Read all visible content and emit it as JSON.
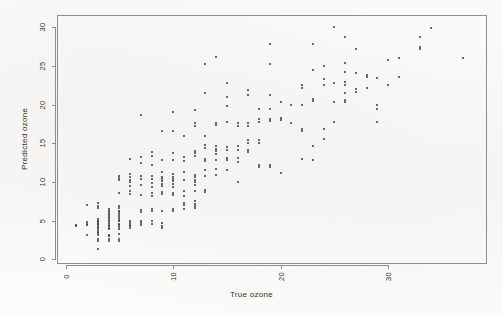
{
  "figure": {
    "width": 503,
    "height": 315,
    "background_color": "#fbfbfa",
    "frame_color": "#8d8d8d",
    "point_color": "#3a3a3a"
  },
  "plot_box": {
    "left": 57,
    "top": 15,
    "right": 487,
    "bottom": 264
  },
  "chart_data": {
    "type": "scatter",
    "title": "",
    "xlabel": "True ozone",
    "ylabel": "Predicted ozone",
    "xlim": [
      -0.8,
      39.2
    ],
    "ylim": [
      -0.6,
      31.6
    ],
    "xticks": [
      0,
      10,
      20,
      30
    ],
    "yticks": [
      0,
      5,
      10,
      15,
      20,
      25,
      30
    ],
    "grid": false,
    "legend": null,
    "marker": "point",
    "marker_size": 2,
    "series": [
      {
        "name": "Predicted vs True ozone",
        "points": [
          [
            1,
            4.4
          ],
          [
            1,
            4.3
          ],
          [
            2,
            7.0
          ],
          [
            2,
            4.8
          ],
          [
            2,
            4.6
          ],
          [
            2,
            4.5
          ],
          [
            2,
            3.2
          ],
          [
            3,
            7.3
          ],
          [
            3,
            6.9
          ],
          [
            3,
            6.6
          ],
          [
            3,
            5.2
          ],
          [
            3,
            5.0
          ],
          [
            3,
            4.9
          ],
          [
            3,
            4.7
          ],
          [
            3,
            4.6
          ],
          [
            3,
            4.4
          ],
          [
            3,
            4.2
          ],
          [
            3,
            4.0
          ],
          [
            3,
            3.8
          ],
          [
            3,
            3.6
          ],
          [
            3,
            3.4
          ],
          [
            3,
            3.2
          ],
          [
            3,
            2.6
          ],
          [
            3,
            2.4
          ],
          [
            3,
            1.3
          ],
          [
            4,
            6.5
          ],
          [
            4,
            6.3
          ],
          [
            4,
            6.1
          ],
          [
            4,
            5.9
          ],
          [
            4,
            5.7
          ],
          [
            4,
            5.5
          ],
          [
            4,
            5.3
          ],
          [
            4,
            5.1
          ],
          [
            4,
            4.9
          ],
          [
            4,
            4.7
          ],
          [
            4,
            4.5
          ],
          [
            4,
            4.3
          ],
          [
            4,
            4.1
          ],
          [
            4,
            3.9
          ],
          [
            4,
            3.2
          ],
          [
            4,
            3.0
          ],
          [
            4,
            2.6
          ],
          [
            4,
            2.4
          ],
          [
            5,
            8.6
          ],
          [
            5,
            6.9
          ],
          [
            5,
            6.6
          ],
          [
            5,
            6.3
          ],
          [
            5,
            6.1
          ],
          [
            5,
            5.9
          ],
          [
            5,
            5.6
          ],
          [
            5,
            5.3
          ],
          [
            5,
            5.1
          ],
          [
            5,
            4.9
          ],
          [
            5,
            4.6
          ],
          [
            5,
            4.4
          ],
          [
            5,
            4.2
          ],
          [
            5,
            3.9
          ],
          [
            5,
            3.3
          ],
          [
            5,
            2.6
          ],
          [
            5,
            2.4
          ],
          [
            5,
            10.8
          ],
          [
            5,
            10.5
          ],
          [
            5,
            10.2
          ],
          [
            6,
            13.0
          ],
          [
            6,
            11.0
          ],
          [
            6,
            10.6
          ],
          [
            6,
            10.3
          ],
          [
            6,
            10.0
          ],
          [
            6,
            9.5
          ],
          [
            6,
            8.8
          ],
          [
            6,
            8.5
          ],
          [
            6,
            5.0
          ],
          [
            6,
            4.7
          ],
          [
            6,
            4.5
          ],
          [
            6,
            4.3
          ],
          [
            6,
            4.0
          ],
          [
            7,
            18.7
          ],
          [
            7,
            13.2
          ],
          [
            7,
            12.4
          ],
          [
            7,
            10.8
          ],
          [
            7,
            10.4
          ],
          [
            7,
            9.6
          ],
          [
            7,
            8.3
          ],
          [
            7,
            6.4
          ],
          [
            7,
            6.1
          ],
          [
            7,
            5.0
          ],
          [
            7,
            4.7
          ],
          [
            7,
            4.5
          ],
          [
            8,
            13.9
          ],
          [
            8,
            13.4
          ],
          [
            8,
            12.2
          ],
          [
            8,
            10.8
          ],
          [
            8,
            10.4
          ],
          [
            8,
            9.9
          ],
          [
            8,
            9.3
          ],
          [
            8,
            8.6
          ],
          [
            8,
            8.2
          ],
          [
            8,
            6.5
          ],
          [
            8,
            6.2
          ],
          [
            8,
            4.9
          ],
          [
            8,
            4.6
          ],
          [
            9,
            16.6
          ],
          [
            9,
            12.8
          ],
          [
            9,
            11.3
          ],
          [
            9,
            10.7
          ],
          [
            9,
            10.4
          ],
          [
            9,
            10.1
          ],
          [
            9,
            9.8
          ],
          [
            9,
            9.5
          ],
          [
            9,
            8.7
          ],
          [
            9,
            8.4
          ],
          [
            9,
            6.2
          ],
          [
            9,
            4.7
          ],
          [
            9,
            4.3
          ],
          [
            9,
            4.0
          ],
          [
            10,
            19.0
          ],
          [
            10,
            16.6
          ],
          [
            10,
            13.8
          ],
          [
            10,
            12.8
          ],
          [
            10,
            11.0
          ],
          [
            10,
            10.7
          ],
          [
            10,
            10.4
          ],
          [
            10,
            10.1
          ],
          [
            10,
            9.8
          ],
          [
            10,
            9.4
          ],
          [
            10,
            8.6
          ],
          [
            10,
            8.3
          ],
          [
            10,
            6.5
          ],
          [
            10,
            6.2
          ],
          [
            11,
            15.9
          ],
          [
            11,
            13.2
          ],
          [
            11,
            12.7
          ],
          [
            11,
            11.3
          ],
          [
            11,
            10.3
          ],
          [
            11,
            8.9
          ],
          [
            11,
            8.2
          ],
          [
            11,
            7.3
          ],
          [
            11,
            7.0
          ],
          [
            11,
            6.5
          ],
          [
            12,
            19.3
          ],
          [
            12,
            17.6
          ],
          [
            12,
            17.2
          ],
          [
            12,
            14.0
          ],
          [
            12,
            13.7
          ],
          [
            12,
            13.4
          ],
          [
            12,
            10.9
          ],
          [
            12,
            10.6
          ],
          [
            12,
            10.3
          ],
          [
            12,
            10.0
          ],
          [
            12,
            9.6
          ],
          [
            12,
            8.8
          ],
          [
            12,
            7.5
          ],
          [
            12,
            7.2
          ],
          [
            12,
            6.9
          ],
          [
            12,
            6.6
          ],
          [
            13,
            25.3
          ],
          [
            13,
            21.5
          ],
          [
            13,
            16.0
          ],
          [
            13,
            14.8
          ],
          [
            13,
            14.4
          ],
          [
            13,
            13.0
          ],
          [
            13,
            12.7
          ],
          [
            13,
            11.5
          ],
          [
            13,
            10.8
          ],
          [
            13,
            9.0
          ],
          [
            13,
            8.7
          ],
          [
            14,
            26.2
          ],
          [
            14,
            17.6
          ],
          [
            14,
            17.4
          ],
          [
            14,
            14.6
          ],
          [
            14,
            14.3
          ],
          [
            14,
            14.0
          ],
          [
            14,
            13.6
          ],
          [
            14,
            12.9
          ],
          [
            14,
            11.7
          ],
          [
            14,
            10.9
          ],
          [
            15,
            22.8
          ],
          [
            15,
            21.0
          ],
          [
            15,
            19.8
          ],
          [
            15,
            17.8
          ],
          [
            15,
            14.5
          ],
          [
            15,
            14.1
          ],
          [
            15,
            13.1
          ],
          [
            15,
            12.8
          ],
          [
            15,
            11.6
          ],
          [
            16,
            17.6
          ],
          [
            16,
            17.3
          ],
          [
            16,
            14.6
          ],
          [
            16,
            14.2
          ],
          [
            16,
            13.1
          ],
          [
            16,
            12.6
          ],
          [
            16,
            10.0
          ],
          [
            17,
            21.9
          ],
          [
            17,
            21.3
          ],
          [
            17,
            17.6
          ],
          [
            17,
            17.2
          ],
          [
            17,
            15.5
          ],
          [
            17,
            15.0
          ],
          [
            17,
            14.2
          ],
          [
            17,
            13.9
          ],
          [
            18,
            19.5
          ],
          [
            18,
            18.1
          ],
          [
            18,
            17.7
          ],
          [
            18,
            15.4
          ],
          [
            18,
            15.1
          ],
          [
            18,
            12.2
          ],
          [
            18,
            11.9
          ],
          [
            19,
            27.8
          ],
          [
            19,
            25.3
          ],
          [
            19,
            21.2
          ],
          [
            19,
            19.5
          ],
          [
            19,
            18.2
          ],
          [
            19,
            17.9
          ],
          [
            19,
            12.2
          ],
          [
            19,
            11.9
          ],
          [
            20,
            20.3
          ],
          [
            20,
            18.3
          ],
          [
            20,
            18.0
          ],
          [
            20,
            11.2
          ],
          [
            21,
            19.9
          ],
          [
            21,
            17.6
          ],
          [
            22,
            22.5
          ],
          [
            22,
            22.2
          ],
          [
            22,
            19.9
          ],
          [
            22,
            16.9
          ],
          [
            22,
            16.6
          ],
          [
            22,
            13.0
          ],
          [
            23,
            27.8
          ],
          [
            23,
            24.5
          ],
          [
            23,
            20.8
          ],
          [
            23,
            20.5
          ],
          [
            23,
            14.6
          ],
          [
            23,
            12.8
          ],
          [
            24,
            25.0
          ],
          [
            24,
            23.3
          ],
          [
            24,
            22.6
          ],
          [
            24,
            16.8
          ],
          [
            24,
            15.6
          ],
          [
            25,
            30.0
          ],
          [
            25,
            22.8
          ],
          [
            25,
            20.4
          ],
          [
            25,
            17.8
          ],
          [
            26,
            28.7
          ],
          [
            26,
            25.4
          ],
          [
            26,
            24.2
          ],
          [
            26,
            23.0
          ],
          [
            26,
            22.6
          ],
          [
            26,
            21.5
          ],
          [
            26,
            20.6
          ],
          [
            26,
            20.3
          ],
          [
            27,
            27.2
          ],
          [
            27,
            24.1
          ],
          [
            27,
            22.0
          ],
          [
            27,
            21.7
          ],
          [
            28,
            23.9
          ],
          [
            28,
            23.6
          ],
          [
            28,
            22.1
          ],
          [
            29,
            23.4
          ],
          [
            29,
            19.9
          ],
          [
            29,
            19.4
          ],
          [
            29,
            17.7
          ],
          [
            30,
            25.8
          ],
          [
            30,
            22.5
          ],
          [
            31,
            26.1
          ],
          [
            31,
            23.6
          ],
          [
            33,
            28.7
          ],
          [
            33,
            27.5
          ],
          [
            33,
            27.2
          ],
          [
            34,
            29.9
          ],
          [
            37,
            26.1
          ]
        ]
      }
    ]
  }
}
